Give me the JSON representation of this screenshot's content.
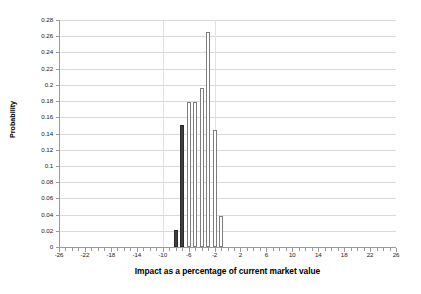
{
  "chart_data": {
    "type": "bar",
    "title": "",
    "xlabel": "Impact as a percentage of current market value",
    "ylabel": "Probability",
    "xlim": [
      -26,
      26
    ],
    "ylim": [
      0,
      0.28
    ],
    "grid": true,
    "legend": "none",
    "x_tick_labels": [
      "-26",
      "-22",
      "-18",
      "-14",
      "-10",
      "-6",
      "-2",
      "2",
      "6",
      "10",
      "14",
      "18",
      "22",
      "26"
    ],
    "x_tick_values": [
      -26,
      -22,
      -18,
      -14,
      -10,
      -6,
      -2,
      2,
      6,
      10,
      14,
      18,
      22,
      26
    ],
    "x_minor_tick_step": 1,
    "y_tick_labels": [
      "0",
      "0.02",
      "0.04",
      "0.06",
      "0.08",
      "0.1",
      "0.12",
      "0.14",
      "0.16",
      "0.18",
      "0.2",
      "0.22",
      "0.24",
      "0.26",
      "0.28"
    ],
    "y_tick_values": [
      0,
      0.02,
      0.04,
      0.06,
      0.08,
      0.1,
      0.12,
      0.14,
      0.16,
      0.18,
      0.2,
      0.22,
      0.24,
      0.26,
      0.28
    ],
    "bar_width_units": 0.62,
    "colors": {
      "filled_bar": "#3f3f3f",
      "outline_bar_face": "#ffffff",
      "outline_bar_edge": "#7d7d7d",
      "gridline": "#d9d9d9",
      "axis": "#9a9a9a",
      "text": "#000000"
    },
    "x": [
      -8,
      -7,
      -6,
      -5,
      -4,
      -3,
      -2,
      -1
    ],
    "values": [
      0.021,
      0.15,
      0.179,
      0.179,
      0.196,
      0.265,
      0.144,
      0.038
    ],
    "bar_styles": [
      "filled",
      "filled",
      "outline",
      "outline",
      "outline",
      "outline",
      "outline",
      "outline"
    ],
    "points": [
      {
        "x": -8,
        "y": 0.021,
        "style": "filled"
      },
      {
        "x": -7,
        "y": 0.15,
        "style": "filled"
      },
      {
        "x": -6,
        "y": 0.179,
        "style": "outline"
      },
      {
        "x": -5,
        "y": 0.179,
        "style": "outline"
      },
      {
        "x": -4,
        "y": 0.196,
        "style": "outline"
      },
      {
        "x": -3,
        "y": 0.265,
        "style": "outline"
      },
      {
        "x": -2,
        "y": 0.144,
        "style": "outline"
      },
      {
        "x": -1,
        "y": 0.038,
        "style": "outline"
      }
    ]
  }
}
